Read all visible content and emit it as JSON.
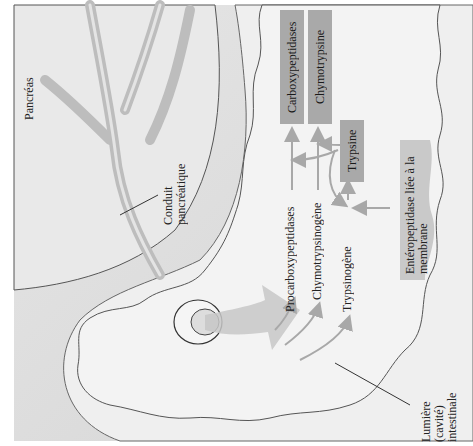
{
  "labels": {
    "pancreas": "Pancréas",
    "duct": "Conduit pancréatique",
    "lumen": "Lumière (cavité) intestinale",
    "enteropeptidase": "Entéropeptidase liée à la membrane"
  },
  "zymogens": [
    {
      "label": "Procarboxypeptidases"
    },
    {
      "label": "Chymotrypsinogène"
    },
    {
      "label": "Trypsinogène"
    }
  ],
  "active_enzymes": [
    {
      "label": "Carboxypeptidases"
    },
    {
      "label": "Chymotrypsine"
    },
    {
      "label": "Trypsine"
    }
  ],
  "colors": {
    "enzyme_box": "#a9a9a9",
    "enteropeptidase_box": "#c9c9c9",
    "arrow": "#a8a8a8",
    "tissue": "#d8d8d8",
    "lumen": "#ececec"
  }
}
